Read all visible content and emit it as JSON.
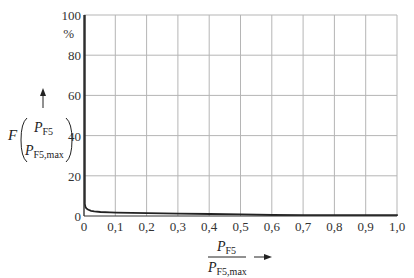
{
  "chart_data": {
    "type": "line",
    "title": "",
    "xlabel": "P_F5 / P_F5,max",
    "ylabel": "F(P_F5 / P_F5,max)",
    "y_unit": "%",
    "xlim": [
      0,
      1.0
    ],
    "ylim": [
      0,
      100
    ],
    "grid": true,
    "legend": null,
    "x_ticks": [
      "0",
      "0,1",
      "0,2",
      "0,3",
      "0,4",
      "0,5",
      "0,6",
      "0,7",
      "0,8",
      "0,9",
      "1,0"
    ],
    "y_ticks": [
      "0",
      "20",
      "40",
      "60",
      "80",
      "100"
    ],
    "series": [
      {
        "name": "F",
        "x": [
          0,
          0,
          0.002,
          0.005,
          0.01,
          0.02,
          0.03,
          0.05,
          0.08,
          0.1,
          0.15,
          0.2,
          0.3,
          0.4,
          0.5,
          0.6,
          0.7,
          0.8,
          0.9,
          1.0
        ],
        "y": [
          100,
          6,
          4.5,
          3.8,
          3.2,
          2.6,
          2.3,
          2.0,
          1.8,
          1.7,
          1.55,
          1.4,
          1.2,
          1.0,
          0.8,
          0.5,
          0.2,
          0.05,
          0,
          0
        ]
      }
    ]
  },
  "labels": {
    "y_unit": "%",
    "y_func": "F",
    "y_frac_num": "P",
    "y_frac_num_sub": "F5",
    "y_frac_den": "P",
    "y_frac_den_sub": "F5,max",
    "x_frac_num": "P",
    "x_frac_num_sub": "F5",
    "x_frac_den": "P",
    "x_frac_den_sub": "F5,max"
  }
}
